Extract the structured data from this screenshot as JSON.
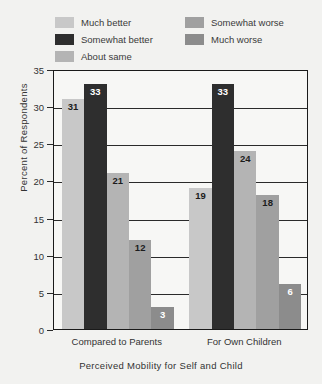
{
  "chart_data": {
    "type": "bar",
    "title": "",
    "xlabel": "Perceived Mobility for Self and Child",
    "ylabel": "Percent of Respondents",
    "categories": [
      "Compared to Parents",
      "For Own Children"
    ],
    "series": [
      {
        "name": "Much better",
        "values": [
          31,
          19
        ],
        "color": "#c8c8c8",
        "label_color": "dark"
      },
      {
        "name": "Somewhat better",
        "values": [
          33,
          33
        ],
        "color": "#2e2e2e",
        "label_color": "light"
      },
      {
        "name": "About same",
        "values": [
          21,
          24
        ],
        "color": "#b4b4b4",
        "label_color": "dark"
      },
      {
        "name": "Somewhat worse",
        "values": [
          12,
          18
        ],
        "color": "#a0a0a0",
        "label_color": "dark"
      },
      {
        "name": "Much worse",
        "values": [
          3,
          6
        ],
        "color": "#8c8c8c",
        "label_color": "light"
      }
    ],
    "ylim": [
      0,
      35
    ],
    "yticks": [
      0,
      5,
      10,
      15,
      20,
      25,
      30,
      35
    ],
    "grid": true,
    "legend_position": "top",
    "legend_columns": 2
  }
}
